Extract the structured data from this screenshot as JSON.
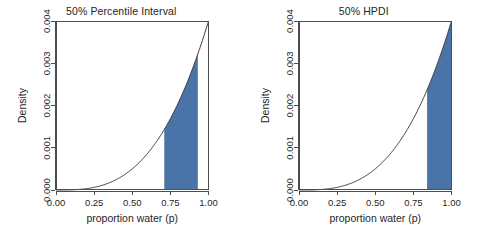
{
  "figure": {
    "background_color": "#ffffff",
    "panel_count": 2
  },
  "chart_data": [
    {
      "type": "area",
      "title": "50% Percentile Interval",
      "xlabel": "proportion water (p)",
      "ylabel": "Density",
      "xlim": [
        0.0,
        1.0
      ],
      "ylim": [
        0.0,
        0.004
      ],
      "xticks": [
        0.0,
        0.25,
        0.5,
        0.75,
        1.0
      ],
      "xticklabels": [
        "0.00",
        "0.25",
        "0.50",
        "0.75",
        "1.00"
      ],
      "yticks": [
        0.0,
        0.001,
        0.002,
        0.003,
        0.004
      ],
      "yticklabels": [
        "0.000",
        "0.001",
        "0.002",
        "0.003",
        "0.004"
      ],
      "grid": false,
      "legend": false,
      "curve_color": "#3b3b3b",
      "shade_color": "#4a74a8",
      "shade_interval": [
        0.71,
        0.93
      ],
      "shade_label": "50% Percentile Interval",
      "x": [
        0.0,
        0.05,
        0.1,
        0.15,
        0.2,
        0.25,
        0.3,
        0.35,
        0.4,
        0.45,
        0.5,
        0.55,
        0.6,
        0.65,
        0.7,
        0.75,
        0.8,
        0.85,
        0.9,
        0.95,
        1.0
      ],
      "y": [
        0.0,
        5e-07,
        4e-06,
        1.35e-05,
        3.2e-05,
        6.25e-05,
        0.000108,
        0.0001715,
        0.000256,
        0.0003645,
        0.0005,
        0.0006655,
        0.000864,
        0.0010985,
        0.001372,
        0.0016875,
        0.002048,
        0.0024565,
        0.002916,
        0.0034295,
        0.004
      ]
    },
    {
      "type": "area",
      "title": "50% HPDI",
      "xlabel": "proportion water (p)",
      "ylabel": "Density",
      "xlim": [
        0.0,
        1.0
      ],
      "ylim": [
        0.0,
        0.004
      ],
      "xticks": [
        0.0,
        0.25,
        0.5,
        0.75,
        1.0
      ],
      "xticklabels": [
        "0.00",
        "0.25",
        "0.50",
        "0.75",
        "1.00"
      ],
      "yticks": [
        0.0,
        0.001,
        0.002,
        0.003,
        0.004
      ],
      "yticklabels": [
        "0.000",
        "0.001",
        "0.002",
        "0.003",
        "0.004"
      ],
      "grid": false,
      "legend": false,
      "curve_color": "#3b3b3b",
      "shade_color": "#4a74a8",
      "shade_interval": [
        0.84,
        1.0
      ],
      "shade_label": "50% HPDI",
      "x": [
        0.0,
        0.05,
        0.1,
        0.15,
        0.2,
        0.25,
        0.3,
        0.35,
        0.4,
        0.45,
        0.5,
        0.55,
        0.6,
        0.65,
        0.7,
        0.75,
        0.8,
        0.85,
        0.9,
        0.95,
        1.0
      ],
      "y": [
        0.0,
        5e-07,
        4e-06,
        1.35e-05,
        3.2e-05,
        6.25e-05,
        0.000108,
        0.0001715,
        0.000256,
        0.0003645,
        0.0005,
        0.0006655,
        0.000864,
        0.0010985,
        0.001372,
        0.0016875,
        0.002048,
        0.0024565,
        0.002916,
        0.0034295,
        0.004
      ]
    }
  ]
}
